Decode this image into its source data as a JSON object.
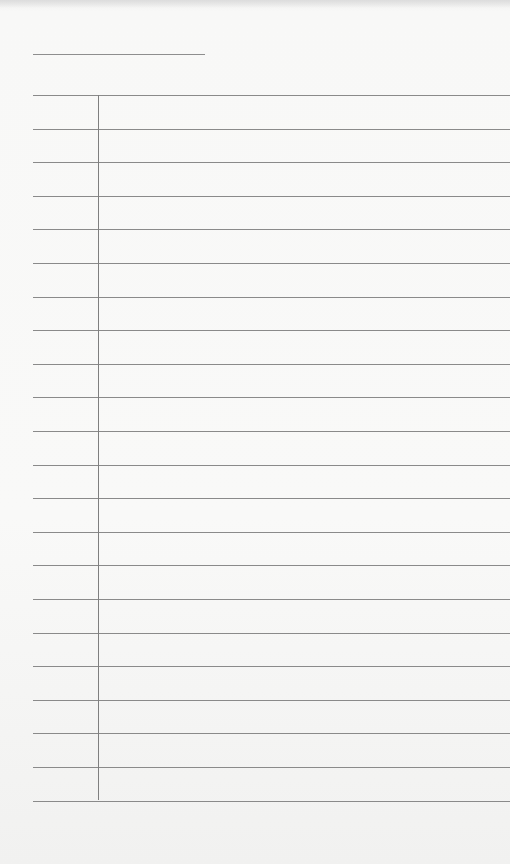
{
  "page": {
    "type": "lined-notepad",
    "background_color": "#f7f7f6",
    "line_color": "#8a8a8a"
  },
  "header": {
    "title_line": {
      "x": 33,
      "y": 54,
      "width": 172
    }
  },
  "ruled_lines": {
    "start_y": 95,
    "spacing": 33.6,
    "count": 22,
    "left": 33
  },
  "margin": {
    "x": 98,
    "top": 95,
    "bottom": 800
  },
  "content": {
    "text": ""
  }
}
